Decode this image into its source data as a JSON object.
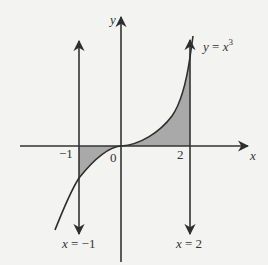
{
  "diagram": {
    "axes": {
      "x_label": "x",
      "y_label": "y",
      "origin_label": "0"
    },
    "ticks": {
      "neg_one": "−1",
      "two": "2"
    },
    "curve": {
      "label_lhs": "y = x",
      "label_exp": "3"
    },
    "lines": {
      "left": {
        "label_lhs": "x",
        "label_rhs": " = −1"
      },
      "right": {
        "label_lhs": "x",
        "label_rhs": " = 2"
      }
    },
    "colors": {
      "background": "#f3f3f1",
      "ink": "#333333",
      "shade": "#a9a9a9"
    }
  }
}
